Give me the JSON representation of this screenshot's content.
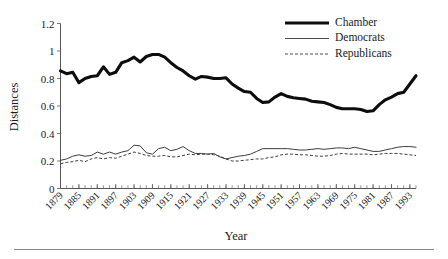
{
  "chart_data": {
    "type": "line",
    "title": "",
    "xlabel": "Year",
    "ylabel": "Distances",
    "xlim": [
      1879,
      1995
    ],
    "ylim": [
      0,
      1.2
    ],
    "grid": false,
    "legend_position": "top-right",
    "ytick_labels": [
      "0",
      "0.2",
      "0.4",
      "0.6",
      "0.8",
      "1",
      "1.2"
    ],
    "ytick_values": [
      0,
      0.2,
      0.4,
      0.6,
      0.8,
      1,
      1.2
    ],
    "xtick_labels": [
      "1879",
      "1885",
      "1891",
      "1897",
      "1903",
      "1909",
      "1915",
      "1921",
      "1927",
      "1933",
      "1939",
      "1945",
      "1951",
      "1957",
      "1963",
      "1969",
      "1975",
      "1981",
      "1987",
      "1993"
    ],
    "xtick_values": [
      1879,
      1885,
      1891,
      1897,
      1903,
      1909,
      1915,
      1921,
      1927,
      1933,
      1939,
      1945,
      1951,
      1957,
      1963,
      1969,
      1975,
      1981,
      1987,
      1993
    ],
    "minor_tick_interval": 2,
    "x": [
      1879,
      1881,
      1883,
      1885,
      1887,
      1889,
      1891,
      1893,
      1895,
      1897,
      1899,
      1901,
      1903,
      1905,
      1907,
      1909,
      1911,
      1913,
      1915,
      1917,
      1919,
      1921,
      1923,
      1925,
      1927,
      1929,
      1931,
      1933,
      1935,
      1937,
      1939,
      1941,
      1943,
      1945,
      1947,
      1949,
      1951,
      1953,
      1955,
      1957,
      1959,
      1961,
      1963,
      1965,
      1967,
      1969,
      1971,
      1973,
      1975,
      1977,
      1979,
      1981,
      1983,
      1985,
      1987,
      1989,
      1991,
      1993,
      1995
    ],
    "series": [
      {
        "name": "Chamber",
        "style": "thick-solid",
        "color": "#0d0d0d",
        "values": [
          0.855,
          0.835,
          0.845,
          0.77,
          0.8,
          0.815,
          0.82,
          0.885,
          0.83,
          0.845,
          0.915,
          0.93,
          0.955,
          0.92,
          0.96,
          0.975,
          0.975,
          0.955,
          0.915,
          0.88,
          0.855,
          0.82,
          0.795,
          0.815,
          0.81,
          0.8,
          0.8,
          0.805,
          0.76,
          0.73,
          0.705,
          0.7,
          0.655,
          0.625,
          0.63,
          0.665,
          0.69,
          0.67,
          0.66,
          0.655,
          0.65,
          0.635,
          0.63,
          0.625,
          0.61,
          0.59,
          0.58,
          0.58,
          0.58,
          0.575,
          0.56,
          0.565,
          0.61,
          0.645,
          0.665,
          0.69,
          0.7,
          0.76,
          0.82
        ]
      },
      {
        "name": "Democrats",
        "style": "thin-solid",
        "color": "#3d3d3d",
        "values": [
          0.205,
          0.215,
          0.235,
          0.245,
          0.235,
          0.24,
          0.265,
          0.25,
          0.265,
          0.25,
          0.265,
          0.275,
          0.315,
          0.31,
          0.26,
          0.25,
          0.29,
          0.3,
          0.275,
          0.285,
          0.305,
          0.275,
          0.255,
          0.255,
          0.25,
          0.255,
          0.23,
          0.215,
          0.225,
          0.235,
          0.24,
          0.25,
          0.27,
          0.29,
          0.29,
          0.29,
          0.29,
          0.29,
          0.285,
          0.28,
          0.28,
          0.285,
          0.29,
          0.285,
          0.29,
          0.295,
          0.295,
          0.29,
          0.3,
          0.29,
          0.28,
          0.27,
          0.27,
          0.28,
          0.29,
          0.3,
          0.305,
          0.305,
          0.3
        ]
      },
      {
        "name": "Republicans",
        "style": "dashed",
        "color": "#3d3d3d",
        "values": [
          0.18,
          0.19,
          0.195,
          0.205,
          0.195,
          0.215,
          0.225,
          0.215,
          0.225,
          0.22,
          0.235,
          0.25,
          0.265,
          0.255,
          0.24,
          0.235,
          0.235,
          0.24,
          0.23,
          0.23,
          0.24,
          0.25,
          0.245,
          0.25,
          0.25,
          0.245,
          0.235,
          0.215,
          0.2,
          0.2,
          0.205,
          0.21,
          0.215,
          0.215,
          0.225,
          0.23,
          0.245,
          0.25,
          0.25,
          0.245,
          0.245,
          0.24,
          0.235,
          0.235,
          0.24,
          0.25,
          0.255,
          0.25,
          0.25,
          0.25,
          0.25,
          0.245,
          0.25,
          0.255,
          0.255,
          0.255,
          0.25,
          0.245,
          0.24
        ]
      }
    ]
  },
  "legend": {
    "items": [
      {
        "label": "Chamber",
        "style": "thick-solid"
      },
      {
        "label": "Democrats",
        "style": "thin-solid"
      },
      {
        "label": "Republicans",
        "style": "dashed"
      }
    ]
  },
  "axes": {
    "y_title": "Distances",
    "x_title": "Year"
  }
}
